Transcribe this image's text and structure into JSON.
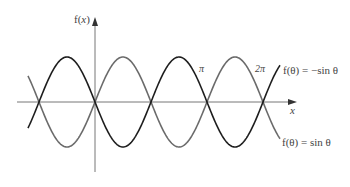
{
  "chart_data": {
    "type": "line",
    "title": "",
    "xlabel": "x",
    "ylabel": "f(x)",
    "x_annotations": [
      "π",
      "2π"
    ],
    "x_range_radians": [
      -3.1,
      5.6
    ],
    "ylim": [
      -1,
      1
    ],
    "grid": false,
    "legend_position": "inline labels at right end of curves",
    "series": [
      {
        "name": "f(θ) = sin θ",
        "color": "#6b6b6b",
        "function": "sin",
        "x": [
          -3.14159,
          -1.5708,
          0,
          1.5708,
          3.14159,
          4.71239,
          6.28319,
          7.85398,
          9.42478
        ],
        "values": [
          0,
          -1,
          0,
          1,
          0,
          -1,
          0,
          1,
          0
        ]
      },
      {
        "name": "f(θ) = −sin θ",
        "color": "#1e1e1e",
        "function": "-sin",
        "x": [
          -3.14159,
          -1.5708,
          0,
          1.5708,
          3.14159,
          4.71239,
          6.28319,
          7.85398,
          9.42478
        ],
        "values": [
          0,
          1,
          0,
          -1,
          0,
          1,
          0,
          -1,
          0
        ]
      }
    ]
  },
  "labels": {
    "y_axis": "f(",
    "y_axis_var": "x",
    "y_axis_close": ")",
    "x_axis": "x",
    "pi": "π",
    "two_pi": "2π",
    "neg_sin": "f(θ) = −sin θ",
    "sin": "f(θ) = sin θ"
  },
  "colors": {
    "axis": "#777777",
    "sin_curve": "#6b6b6b",
    "neg_sin_curve": "#1e1e1e",
    "text": "#444444"
  }
}
